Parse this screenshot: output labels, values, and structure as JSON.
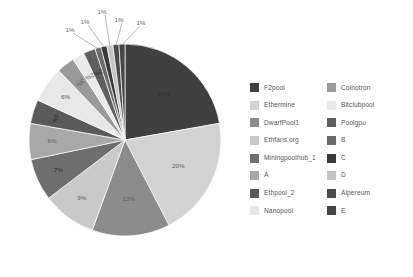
{
  "chart_data": {
    "type": "pie",
    "title": "",
    "subtitle": "",
    "xlabel": "",
    "ylabel": "",
    "legend_position": "right",
    "grid": false,
    "value_suffix": "%",
    "categories": [
      "F2pool",
      "Ethermine",
      "DwarfPool1",
      "Ethfans.org",
      "Miningpoolhub_1",
      "A",
      "Ethpool_2",
      "Nanopool",
      "Coinotron",
      "Bitclubpool",
      "Poolgpu",
      "B",
      "C",
      "D",
      "Alpereum",
      "E"
    ],
    "values": [
      22,
      20,
      13,
      9,
      7,
      6,
      4,
      6,
      3,
      2,
      2,
      1,
      1,
      1,
      1,
      1
    ],
    "labels": [
      "22%",
      "20%",
      "13%",
      "9%",
      "7%",
      "6%",
      "4%",
      "6%",
      "3%",
      "2%",
      "2%",
      "1%",
      "1%",
      "1%",
      "1%",
      "1%"
    ],
    "colors": [
      "#404040",
      "#d2d2d2",
      "#8c8c8c",
      "#c9c9c9",
      "#6e6e6e",
      "#a8a8a8",
      "#5a5a5a",
      "#e8e8e8",
      "#9a9a9a",
      "#eaeaea",
      "#5f5f5f",
      "#6b6b6b",
      "#3a3a3a",
      "#c4c4c4",
      "#4a4a4a",
      "#454545"
    ]
  },
  "legend": {
    "items": [
      {
        "label": "F2pool",
        "color": "#404040"
      },
      {
        "label": "Coinotron",
        "color": "#9a9a9a"
      },
      {
        "label": "Ethermine",
        "color": "#d2d2d2"
      },
      {
        "label": "Bitclubpool",
        "color": "#eaeaea"
      },
      {
        "label": "DwarfPool1",
        "color": "#8c8c8c"
      },
      {
        "label": "Poolgpu",
        "color": "#5f5f5f"
      },
      {
        "label": "Ethfans.org",
        "color": "#c9c9c9"
      },
      {
        "label": "B",
        "color": "#6b6b6b"
      },
      {
        "label": "Miningpoolhub_1",
        "color": "#6e6e6e"
      },
      {
        "label": "C",
        "color": "#3a3a3a"
      },
      {
        "label": "A",
        "color": "#a8a8a8"
      },
      {
        "label": "D",
        "color": "#c4c4c4"
      },
      {
        "label": "Ethpool_2",
        "color": "#5a5a5a"
      },
      {
        "label": "Alpereum",
        "color": "#4a4a4a"
      },
      {
        "label": "Nanopool",
        "color": "#e8e8e8"
      },
      {
        "label": "E",
        "color": "#454545"
      }
    ]
  }
}
